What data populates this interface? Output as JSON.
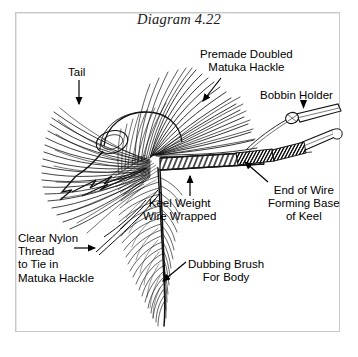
{
  "figure": {
    "title": "Diagram 4.22",
    "type": "instructional line drawing",
    "frame": {
      "border_color": "#c9c9c9",
      "background_color": "#ffffff"
    },
    "ink_color": "#000000",
    "labels": [
      {
        "id": "tail",
        "text": "Tail",
        "lines": [
          "Tail"
        ],
        "align": "center",
        "leader": "arrow pointing down to tail fibers"
      },
      {
        "id": "premade-doubled-matuka-hackle",
        "text": "Premade Doubled Matuka Hackle",
        "lines": [
          "Premade Doubled",
          "Matuka Hackle"
        ],
        "align": "center",
        "leader": "arrow pointing down-left to hackle wing"
      },
      {
        "id": "bobbin-holder",
        "text": "Bobbin Holder",
        "lines": [
          "Bobbin Holder"
        ],
        "align": "center",
        "leader": "solid arrowhead pointing down to bobbin tool"
      },
      {
        "id": "end-of-wire-forming-base-of-keel",
        "text": "End of Wire Forming Base of Keel",
        "lines": [
          "End of Wire",
          "Forming Base",
          "of Keel"
        ],
        "align": "center",
        "leader": "arrow pointing up-left to wire end"
      },
      {
        "id": "keel-weight-wire-wrapped",
        "text": "Keel Weight Wire Wrapped",
        "lines": [
          "Keel Weight",
          "Wire Wrapped"
        ],
        "align": "center",
        "leader": "arrow pointing up to wrapped wire body"
      },
      {
        "id": "clear-nylon-thread-to-tie-in-matuka-hackle",
        "text": "Clear Nylon Thread to Tie in Matuka Hackle",
        "lines": [
          "Clear Nylon",
          "Thread",
          "to Tie in",
          "Matuka Hackle"
        ],
        "align": "left",
        "inline_arrow_line": 2,
        "leader": "inline right arrow on second line pointing at nylon thread"
      },
      {
        "id": "dubbing-brush-for-body",
        "text": "Dubbing Brush For Body",
        "lines": [
          "Dubbing Brush",
          "For Body"
        ],
        "align": "center",
        "leader": "arrow pointing down-left to dubbing brush"
      }
    ],
    "parts": [
      "hook with barbed point",
      "matuka hackle wing",
      "tail fibers",
      "wire-wrapped keel weight",
      "dubbing brush for body",
      "bobbin holder tool",
      "bodkin / wire end tool"
    ]
  }
}
